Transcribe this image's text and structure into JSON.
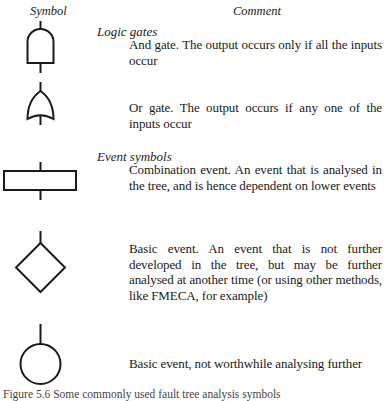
{
  "columns": {
    "symbol_header": "Symbol",
    "comment_header": "Comment"
  },
  "sections": [
    {
      "title": "Logic gates",
      "items": [
        {
          "symbol": "and-gate",
          "description": "And gate. The output occurs only if all the inputs occur"
        },
        {
          "symbol": "or-gate",
          "description": "Or gate. The output occurs if any one of the inputs occur"
        }
      ]
    },
    {
      "title": "Event symbols",
      "items": [
        {
          "symbol": "combination-event-rectangle",
          "description": "Combination event. An event that is analysed in the tree, and is hence dependent on lower events"
        },
        {
          "symbol": "basic-event-diamond",
          "description": "Basic event. An event that is not further developed in the tree, but may be further analysed at another time (or using other methods, like FMECA, for example)"
        },
        {
          "symbol": "basic-event-circle",
          "description": "Basic event, not worthwhile analysing further"
        }
      ]
    }
  ],
  "caption": "Figure 5.6 Some commonly used fault tree analysis symbols"
}
